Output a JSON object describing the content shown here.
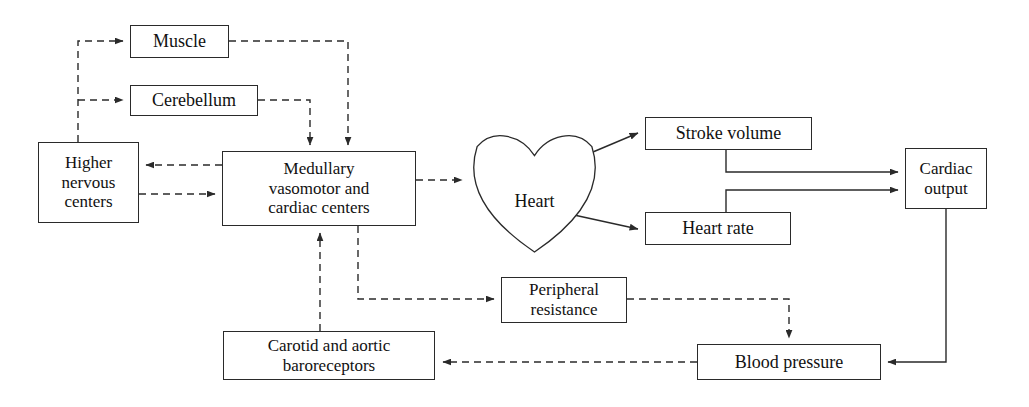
{
  "figure": {
    "kind": "flow-diagram",
    "background_color": "#ffffff",
    "line_color": "#2a2a2a",
    "text_color": "#111111"
  },
  "nodes": [
    {
      "id": "muscle",
      "label": "Muscle",
      "shape": "rect",
      "x": 130,
      "y": 25,
      "w": 99,
      "h": 33,
      "font_size": 18
    },
    {
      "id": "cerebellum",
      "label": "Cerebellum",
      "shape": "rect",
      "x": 130,
      "y": 85,
      "w": 128,
      "h": 31,
      "font_size": 18
    },
    {
      "id": "higher",
      "label": "Higher\nnervous\ncenters",
      "shape": "rect",
      "x": 38,
      "y": 142,
      "w": 101,
      "h": 81,
      "font_size": 17
    },
    {
      "id": "medullary",
      "label": "Medullary\nvasomotor and\ncardiac centers",
      "shape": "rect",
      "x": 222,
      "y": 151,
      "w": 194,
      "h": 75,
      "font_size": 17
    },
    {
      "id": "heart",
      "label": "Heart",
      "shape": "heart",
      "x": 470,
      "y": 133,
      "w": 129,
      "h": 119,
      "font_size": 18
    },
    {
      "id": "stroke_volume",
      "label": "Stroke volume",
      "shape": "rect",
      "x": 645,
      "y": 117,
      "w": 167,
      "h": 33,
      "font_size": 18
    },
    {
      "id": "heart_rate",
      "label": "Heart rate",
      "shape": "rect",
      "x": 645,
      "y": 212,
      "w": 146,
      "h": 33,
      "font_size": 18
    },
    {
      "id": "cardiac_output",
      "label": "Cardiac\noutput",
      "shape": "rect",
      "x": 905,
      "y": 148,
      "w": 82,
      "h": 61,
      "font_size": 17
    },
    {
      "id": "peripheral",
      "label": "Peripheral\nresistance",
      "shape": "rect",
      "x": 501,
      "y": 277,
      "w": 126,
      "h": 46,
      "font_size": 17
    },
    {
      "id": "blood_pressure",
      "label": "Blood pressure",
      "shape": "rect",
      "x": 697,
      "y": 344,
      "w": 184,
      "h": 36,
      "font_size": 18
    },
    {
      "id": "baroreceptors",
      "label": "Carotid and aortic\nbaroreceptors",
      "shape": "rect",
      "x": 223,
      "y": 331,
      "w": 212,
      "h": 49,
      "font_size": 17
    }
  ],
  "edges": [
    {
      "id": "higher-to-muscle",
      "from": "higher",
      "to": "muscle",
      "style": "dashed",
      "arrow": true,
      "points": "78,142 78,41 123,41"
    },
    {
      "id": "higher-to-cerebellum",
      "from": "higher",
      "to": "cerebellum",
      "style": "dashed",
      "arrow": true,
      "points": "78,100 123,100"
    },
    {
      "id": "muscle-to-medullary",
      "from": "muscle",
      "to": "medullary",
      "style": "dashed",
      "arrow": true,
      "points": "229,41 348,41 348,145"
    },
    {
      "id": "cerebellum-to-medullary",
      "from": "cerebellum",
      "to": "medullary",
      "style": "dashed",
      "arrow": true,
      "points": "258,100 310,100 310,145"
    },
    {
      "id": "medullary-to-higher",
      "from": "medullary",
      "to": "higher",
      "style": "dashed",
      "arrow": true,
      "points": "222,165 146,165"
    },
    {
      "id": "higher-to-medullary",
      "from": "higher",
      "to": "medullary",
      "style": "dashed",
      "arrow": true,
      "points": "139,194 215,194"
    },
    {
      "id": "medullary-to-heart",
      "from": "medullary",
      "to": "heart",
      "style": "dashed",
      "arrow": true,
      "points": "416,180 462,180"
    },
    {
      "id": "heart-to-stroke-volume",
      "from": "heart",
      "to": "stroke_volume",
      "style": "solid",
      "arrow": true,
      "points": "574,160 638,133"
    },
    {
      "id": "heart-to-heart-rate",
      "from": "heart",
      "to": "heart_rate",
      "style": "solid",
      "arrow": true,
      "points": "574,215 638,229"
    },
    {
      "id": "stroke-volume-to-output",
      "from": "stroke_volume",
      "to": "cardiac_output",
      "style": "solid",
      "arrow": true,
      "points": "726,150 726,172 898,172"
    },
    {
      "id": "heart-rate-to-output",
      "from": "heart_rate",
      "to": "cardiac_output",
      "style": "solid",
      "arrow": true,
      "points": "726,212 726,190 898,190"
    },
    {
      "id": "output-to-blood-pressure",
      "from": "cardiac_output",
      "to": "blood_pressure",
      "style": "solid",
      "arrow": true,
      "points": "946,209 946,362 888,362"
    },
    {
      "id": "medullary-to-peripheral",
      "from": "medullary",
      "to": "peripheral",
      "style": "dashed",
      "arrow": true,
      "points": "358,226 358,299 494,299"
    },
    {
      "id": "peripheral-to-blood-pressure",
      "from": "peripheral",
      "to": "blood_pressure",
      "style": "dashed",
      "arrow": true,
      "points": "627,299 789,299 789,338"
    },
    {
      "id": "blood-pressure-to-baro",
      "from": "blood_pressure",
      "to": "baroreceptors",
      "style": "dashed",
      "arrow": true,
      "points": "697,362 443,362"
    },
    {
      "id": "baro-to-medullary",
      "from": "baroreceptors",
      "to": "medullary",
      "style": "dashed",
      "arrow": true,
      "points": "320,331 320,233"
    }
  ]
}
